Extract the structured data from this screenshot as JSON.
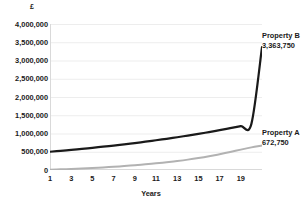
{
  "chart_data": {
    "type": "line",
    "title": "",
    "xlabel": "Years",
    "ylabel": "£",
    "x": [
      1,
      2,
      3,
      4,
      5,
      6,
      7,
      8,
      9,
      10,
      11,
      12,
      13,
      14,
      15,
      16,
      17,
      18,
      19,
      20,
      21
    ],
    "xlim": [
      1,
      21
    ],
    "ylim": [
      0,
      4000000
    ],
    "xticks": [
      "1",
      "3",
      "5",
      "7",
      "9",
      "11",
      "13",
      "15",
      "17",
      "19"
    ],
    "xtick_values": [
      1,
      3,
      5,
      7,
      9,
      11,
      13,
      15,
      17,
      19
    ],
    "yticks": [
      "0",
      "500,000",
      "1,000,000",
      "1,500,000",
      "2,000,000",
      "2,500,000",
      "3,000,000",
      "3,500,000",
      "4,000,000"
    ],
    "ytick_values": [
      0,
      500000,
      1000000,
      1500000,
      2000000,
      2500000,
      3000000,
      3500000,
      4000000
    ],
    "grid": "horizontal",
    "legend_position": "right-inline-annotation",
    "series": [
      {
        "name": "Property B",
        "end_label": "3,363,750",
        "end_value": 3363750,
        "color": "#1a1a1a",
        "values": [
          500000,
          525000,
          551250,
          578813,
          607753,
          638141,
          670048,
          703551,
          738728,
          775665,
          814448,
          855170,
          897929,
          942825,
          989966,
          1039465,
          1091438,
          1146010,
          1203310,
          1263476,
          3363750
        ]
      },
      {
        "name": "Property A",
        "end_label": "672,750",
        "end_value": 672750,
        "color": "#b2b2b2",
        "values": [
          10000,
          18000,
          28000,
          40000,
          54000,
          70000,
          88000,
          108000,
          130000,
          155000,
          182000,
          212000,
          246000,
          284000,
          327000,
          376000,
          431000,
          492000,
          559000,
          620000,
          672750
        ]
      }
    ]
  },
  "axis": {
    "y_title": "£",
    "x_title": "Years"
  }
}
